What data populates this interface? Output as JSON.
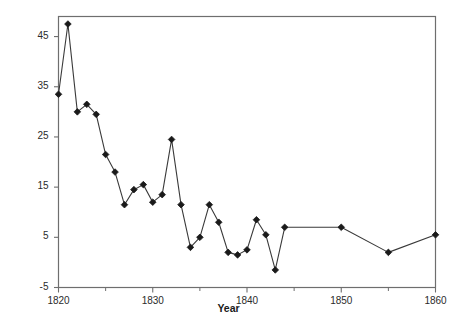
{
  "chart_data": {
    "type": "line",
    "title": "",
    "xlabel": "Year",
    "ylabel": "Compound Annual Percentage Change",
    "xlim": [
      1820,
      1860
    ],
    "ylim": [
      -5,
      49
    ],
    "xticks": [
      1820,
      1830,
      1840,
      1850,
      1860
    ],
    "xticklabels": [
      "1820",
      "1830",
      "1840",
      "1850",
      "1860"
    ],
    "yticks": [
      -5,
      5,
      15,
      25,
      35,
      45
    ],
    "yticklabels": [
      "-5",
      "5",
      "15",
      "25",
      "35",
      "45"
    ],
    "x_minor_ticks": [
      1825,
      1835,
      1845,
      1855
    ],
    "grid": false,
    "legend": null,
    "marker": "diamond",
    "marker_color": "#1a1a1a",
    "line_color": "#3a3a3a",
    "frame_color": "#6e6e6e",
    "background": "#ffffff",
    "series": [
      {
        "name": "Compound Annual Percentage Change",
        "x": [
          1820,
          1821,
          1822,
          1823,
          1824,
          1825,
          1826,
          1827,
          1828,
          1829,
          1830,
          1831,
          1832,
          1833,
          1834,
          1835,
          1836,
          1837,
          1838,
          1839,
          1840,
          1841,
          1842,
          1843,
          1844,
          1850,
          1855,
          1860
        ],
        "values": [
          33.5,
          47.5,
          30.0,
          31.5,
          29.5,
          21.5,
          18.0,
          11.5,
          14.5,
          15.5,
          12.0,
          13.5,
          24.5,
          11.5,
          3.0,
          5.0,
          11.5,
          8.0,
          2.0,
          1.5,
          2.5,
          8.5,
          5.5,
          -1.5,
          7.0,
          7.0,
          2.0,
          5.5
        ]
      }
    ]
  },
  "axes": {
    "y_title": "Compound Annual Percentage Change",
    "x_title": "Year"
  },
  "ticks": {
    "y": [
      "45",
      "35",
      "25",
      "15",
      "5",
      "-5"
    ],
    "x": [
      "1820",
      "1830",
      "1840",
      "1850",
      "1860"
    ]
  }
}
